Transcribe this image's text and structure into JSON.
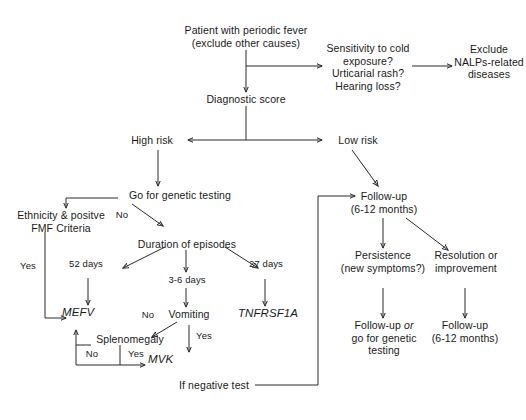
{
  "diagram": {
    "type": "flowchart",
    "background_color": "#ffffff",
    "line_color": "#2a2a2a",
    "text_color": "#1a1a1a"
  },
  "nodes": {
    "patient": "Patient with periodic fever\n(exclude other causes)",
    "nalp_questions": "Sensitivity to cold\nexposure?\nUrticarial rash?\nHearing loss?",
    "exclude_nalps": "Exclude\nNALPs-related\ndiseases",
    "diagnostic_score": "Diagnostic score",
    "high_risk": "High risk",
    "low_risk": "Low risk",
    "genetic_testing": "Go for genetic testing",
    "ethnicity_fmf": "Ethnicity & positve\nFMF Criteria",
    "duration": "Duration of episodes",
    "mefv": "MEFV",
    "vomiting": "Vomiting",
    "tnfrsf1a": "TNFRSF1A",
    "splenomegaly": "Splenomegaly",
    "mvk": "MVK",
    "if_negative": "If negative test",
    "followup_top": "Follow-up\n(6-12 months)",
    "persistence": "Persistence\n(new symptoms?)",
    "resolution": "Resolution or\nimprovement",
    "followup_genetic_pre": "Follow-up ",
    "followup_genetic_or": "or",
    "followup_genetic_post": "\ngo for genetic\ntesting",
    "followup_bottom": "Follow-up\n(6-12 months)"
  },
  "edge_labels": {
    "no_fmf": "No",
    "yes_fmf": "Yes",
    "days_52": "52 days",
    "days_3_6": "3-6 days",
    "days_27": "27 days",
    "no_vomiting": "No",
    "yes_vomiting": "Yes",
    "no_spleno": "No",
    "yes_spleno": "Yes"
  }
}
